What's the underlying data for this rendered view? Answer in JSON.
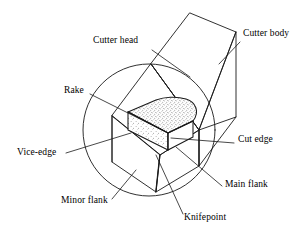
{
  "figure": {
    "kind": "engineering-diagram",
    "background_color": "#ffffff",
    "line_color": "#1a1a1a",
    "insert_fill": "stippled-gray",
    "width": 308,
    "height": 241
  },
  "labels": [
    {
      "id": "cutter-head",
      "text": "Cutter head",
      "x": 93,
      "y": 39,
      "leader": [
        [
          152,
          50
        ],
        [
          190,
          77
        ]
      ]
    },
    {
      "id": "cutter-body",
      "text": "Cutter body",
      "x": 243,
      "y": 32,
      "leader": [
        [
          240,
          42
        ],
        [
          219,
          64
        ]
      ]
    },
    {
      "id": "rake",
      "text": "Rake",
      "x": 64,
      "y": 89,
      "leader": [
        [
          90,
          94
        ],
        [
          162,
          130
        ]
      ]
    },
    {
      "id": "vice-edge",
      "text": "Vice-edge",
      "x": 17,
      "y": 151,
      "leader": [
        [
          66,
          153
        ],
        [
          131,
          133
        ]
      ]
    },
    {
      "id": "cut-edge",
      "text": "Cut edge",
      "x": 237,
      "y": 138,
      "leader": [
        [
          234,
          143
        ],
        [
          171,
          138
        ]
      ]
    },
    {
      "id": "main-flank",
      "text": "Main flank",
      "x": 224,
      "y": 183,
      "leader": [
        [
          222,
          186
        ],
        [
          176,
          147
        ]
      ]
    },
    {
      "id": "minor-flank",
      "text": "Minor flank",
      "x": 61,
      "y": 199,
      "leader": [
        [
          112,
          199
        ],
        [
          136,
          170
        ]
      ]
    },
    {
      "id": "knifepoint",
      "text": "Knifepoint",
      "x": 184,
      "y": 216,
      "leader": [
        [
          183,
          216
        ],
        [
          156,
          155
        ]
      ]
    }
  ],
  "geometry": {
    "detail_circle": {
      "cx": 149,
      "cy": 130,
      "r": 66
    },
    "shank_outline": [
      [
        190,
        13
      ],
      [
        236,
        32
      ],
      [
        236,
        117
      ],
      [
        199,
        130
      ],
      [
        151,
        64
      ]
    ],
    "shank_ridge": [
      [
        190,
        13
      ],
      [
        151,
        64
      ]
    ],
    "shank_near_face": [
      [
        151,
        64
      ],
      [
        199,
        130
      ],
      [
        236,
        117
      ]
    ],
    "head_top_face": [
      [
        151,
        64
      ],
      [
        199,
        130
      ],
      [
        160,
        155
      ],
      [
        112,
        116
      ]
    ],
    "head_front_face": [
      [
        112,
        116
      ],
      [
        160,
        155
      ],
      [
        156,
        192
      ],
      [
        112,
        162
      ]
    ],
    "head_right_face": [
      [
        160,
        155
      ],
      [
        199,
        130
      ],
      [
        199,
        166
      ],
      [
        156,
        192
      ]
    ],
    "insert_top_face": [
      [
        131,
        110
      ],
      [
        171,
        131
      ],
      [
        196,
        119
      ],
      [
        158,
        99
      ]
    ],
    "insert_front_face": [
      [
        131,
        110
      ],
      [
        171,
        131
      ],
      [
        171,
        148
      ],
      [
        131,
        129
      ]
    ],
    "insert_right_face": [
      [
        171,
        131
      ],
      [
        196,
        119
      ],
      [
        196,
        136
      ],
      [
        171,
        148
      ]
    ]
  }
}
